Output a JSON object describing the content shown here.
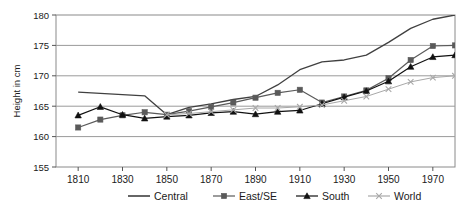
{
  "chart_data": {
    "type": "line",
    "title": "",
    "xlabel": "",
    "ylabel": "Height in cm",
    "xlim": [
      1800,
      1980
    ],
    "ylim": [
      155,
      180
    ],
    "yticks": [
      155,
      160,
      165,
      170,
      175,
      180
    ],
    "xticks": [
      1810,
      1830,
      1850,
      1870,
      1890,
      1910,
      1930,
      1950,
      1970
    ],
    "grid": "horizontal",
    "legend_position": "bottom",
    "x": [
      1810,
      1820,
      1830,
      1840,
      1850,
      1860,
      1870,
      1880,
      1890,
      1900,
      1910,
      1920,
      1930,
      1940,
      1950,
      1960,
      1970,
      1980
    ],
    "series": [
      {
        "name": "Central",
        "color": "#404040",
        "marker": "none",
        "values": [
          167.3,
          167.1,
          166.9,
          166.7,
          163.6,
          164.8,
          165.4,
          166.1,
          166.6,
          168.5,
          171.0,
          172.3,
          172.6,
          173.4,
          175.5,
          177.8,
          179.3,
          180.0
        ]
      },
      {
        "name": "East/SE",
        "color": "#5a5a5a",
        "marker": "square",
        "values": [
          161.5,
          162.8,
          163.5,
          164.0,
          163.6,
          164.2,
          164.9,
          165.6,
          166.4,
          167.2,
          167.7,
          165.6,
          166.6,
          167.6,
          169.6,
          172.6,
          174.9,
          175.0
        ]
      },
      {
        "name": "South",
        "color": "#111111",
        "marker": "triangle",
        "values": [
          163.5,
          164.9,
          163.6,
          163.0,
          163.3,
          163.5,
          163.9,
          164.1,
          163.7,
          164.1,
          164.3,
          165.4,
          166.5,
          167.5,
          169.1,
          171.5,
          173.1,
          173.4
        ]
      },
      {
        "name": "World",
        "color": "#a8a8a8",
        "marker": "x",
        "values": [
          null,
          null,
          null,
          null,
          163.6,
          163.8,
          164.1,
          164.4,
          164.7,
          164.7,
          164.9,
          165.2,
          165.9,
          166.6,
          167.8,
          169.0,
          169.7,
          170.0
        ]
      }
    ]
  },
  "legend": {
    "items": [
      {
        "label": "Central",
        "marker": "line"
      },
      {
        "label": "East/SE",
        "marker": "square"
      },
      {
        "label": "South",
        "marker": "triangle"
      },
      {
        "label": "World",
        "marker": "x"
      }
    ]
  },
  "axes": {
    "y_title": "Height in cm",
    "y_tick_labels": [
      "180",
      "175",
      "170",
      "165",
      "160",
      "155"
    ],
    "x_tick_labels": [
      "1810",
      "1830",
      "1850",
      "1870",
      "1890",
      "1910",
      "1930",
      "1950",
      "1970"
    ]
  }
}
